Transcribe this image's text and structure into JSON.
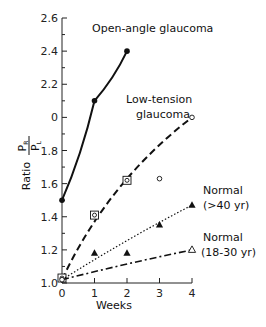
{
  "chart_data": {
    "type": "line",
    "title": "",
    "xlabel": "Weeks",
    "ylabel": "Ratio P_R / P_L",
    "ylabel_parts": {
      "prefix": "Ratio",
      "numerator": "P",
      "numerator_sub": "R",
      "denominator": "P",
      "denominator_sub": "L"
    },
    "xlim": [
      0,
      4
    ],
    "ylim": [
      1.0,
      2.6
    ],
    "x_ticks": [
      0,
      1,
      2,
      3,
      4
    ],
    "x_tick_labels": [
      "0",
      "1",
      "2",
      "3",
      "4"
    ],
    "y_ticks": [
      1.0,
      1.2,
      1.4,
      1.6,
      1.8,
      2.0,
      2.2,
      2.4,
      2.6
    ],
    "y_tick_labels": [
      "1.0",
      "1.2",
      "1.4",
      "1.6",
      "1.8",
      "0",
      "2.2",
      "2.4",
      "2.6"
    ],
    "grid": false,
    "series": [
      {
        "name": "Open-angle glaucoma",
        "style": "solid",
        "marker": "filled-circle",
        "x": [
          0,
          1,
          2
        ],
        "values": [
          1.5,
          2.1,
          2.4
        ]
      },
      {
        "name": "Low-tension glaucoma",
        "style": "dashed",
        "marker": "open-circle",
        "line": {
          "x": [
            0,
            4
          ],
          "values": [
            1.02,
            2.0
          ]
        },
        "points": [
          {
            "x": 0,
            "y": 1.03,
            "marker": "square-circle"
          },
          {
            "x": 1,
            "y": 1.41,
            "marker": "square-circle"
          },
          {
            "x": 2,
            "y": 1.62,
            "marker": "square-circle"
          },
          {
            "x": 3,
            "y": 1.63,
            "marker": "open-circle"
          },
          {
            "x": 4,
            "y": 2.0,
            "marker": "open-circle"
          }
        ]
      },
      {
        "name": "Normal (>40 yr)",
        "style": "dotted",
        "marker": "filled-triangle",
        "line": {
          "x": [
            0,
            4
          ],
          "values": [
            1.02,
            1.47
          ]
        },
        "x": [
          1,
          2,
          3,
          4
        ],
        "values": [
          1.18,
          1.18,
          1.35,
          1.47
        ]
      },
      {
        "name": "Normal (18-30 yr)",
        "style": "dash-dot",
        "marker": "open-triangle",
        "line": {
          "x": [
            0,
            4
          ],
          "values": [
            1.02,
            1.2
          ]
        },
        "x": [
          4
        ],
        "values": [
          1.2
        ]
      }
    ],
    "annotations": [
      {
        "text": "Open-angle glaucoma",
        "near": "series-1"
      },
      {
        "text": "Low-tension",
        "near": "series-2"
      },
      {
        "text": "glaucoma",
        "near": "series-2"
      },
      {
        "text": "Normal",
        "near": "series-3"
      },
      {
        "text": "(>40 yr)",
        "near": "series-3"
      },
      {
        "text": "Normal",
        "near": "series-4"
      },
      {
        "text": "(18-30 yr)",
        "near": "series-4"
      }
    ]
  },
  "labels": {
    "open_angle": "Open-angle glaucoma",
    "low_tension_1": "Low-tension",
    "low_tension_2": "glaucoma",
    "normal40_1": "Normal",
    "normal40_2": "(>40 yr)",
    "normal18_1": "Normal",
    "normal18_2": "(18-30 yr)",
    "xlabel": "Weeks",
    "ylabel_prefix": "Ratio",
    "ylabel_num": "P",
    "ylabel_num_sub": "R",
    "ylabel_den": "P",
    "ylabel_den_sub": "L"
  }
}
